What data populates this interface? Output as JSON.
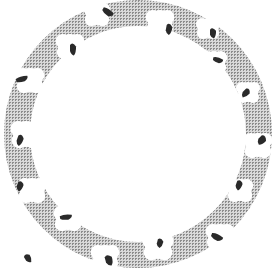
{
  "diagram": {
    "type": "ring",
    "canvas": {
      "width": 280,
      "height": 269
    },
    "center": {
      "x": 138,
      "y": 134
    },
    "outer_radius": 134,
    "inner_radius": 108,
    "colors": {
      "background": "#ffffff",
      "ring_pattern_dark": "#8c8c8c",
      "ring_pattern_light": "#d9d9d9",
      "blob": "#2a2a2a",
      "notch": "#ffffff"
    },
    "notches": [
      {
        "x": 97,
        "y": 14,
        "r": 11
      },
      {
        "x": 160,
        "y": 22,
        "r": 12
      },
      {
        "x": 208,
        "y": 28,
        "r": 10
      },
      {
        "x": 70,
        "y": 46,
        "r": 12
      },
      {
        "x": 214,
        "y": 62,
        "r": 11
      },
      {
        "x": 30,
        "y": 80,
        "r": 12
      },
      {
        "x": 248,
        "y": 92,
        "r": 10
      },
      {
        "x": 26,
        "y": 134,
        "r": 13
      },
      {
        "x": 258,
        "y": 145,
        "r": 12
      },
      {
        "x": 32,
        "y": 190,
        "r": 12
      },
      {
        "x": 240,
        "y": 190,
        "r": 11
      },
      {
        "x": 68,
        "y": 218,
        "r": 12
      },
      {
        "x": 220,
        "y": 236,
        "r": 12
      },
      {
        "x": 158,
        "y": 246,
        "r": 13
      },
      {
        "x": 105,
        "y": 257,
        "r": 12
      }
    ],
    "blobs": [
      {
        "x": 108,
        "y": 12,
        "w": 12,
        "h": 7,
        "rot": 30
      },
      {
        "x": 169,
        "y": 29,
        "w": 6,
        "h": 12,
        "rot": 10
      },
      {
        "x": 213,
        "y": 33,
        "w": 6,
        "h": 11,
        "rot": 0
      },
      {
        "x": 73,
        "y": 49,
        "w": 6,
        "h": 13,
        "rot": 0
      },
      {
        "x": 218,
        "y": 60,
        "w": 10,
        "h": 6,
        "rot": 10
      },
      {
        "x": 22,
        "y": 79,
        "w": 12,
        "h": 6,
        "rot": -20
      },
      {
        "x": 246,
        "y": 93,
        "w": 6,
        "h": 11,
        "rot": 45
      },
      {
        "x": 20,
        "y": 140,
        "w": 6,
        "h": 12,
        "rot": 20
      },
      {
        "x": 262,
        "y": 140,
        "w": 7,
        "h": 11,
        "rot": 45
      },
      {
        "x": 66,
        "y": 217,
        "w": 12,
        "h": 6,
        "rot": -10
      },
      {
        "x": 239,
        "y": 185,
        "w": 6,
        "h": 11,
        "rot": 20
      },
      {
        "x": 20,
        "y": 186,
        "w": 6,
        "h": 11,
        "rot": 20
      },
      {
        "x": 109,
        "y": 260,
        "w": 7,
        "h": 12,
        "rot": -15
      },
      {
        "x": 160,
        "y": 243,
        "w": 6,
        "h": 10,
        "rot": 15
      },
      {
        "x": 217,
        "y": 237,
        "w": 12,
        "h": 7,
        "rot": 20
      },
      {
        "x": 28,
        "y": 258,
        "w": 6,
        "h": 10,
        "rot": -30
      }
    ]
  }
}
